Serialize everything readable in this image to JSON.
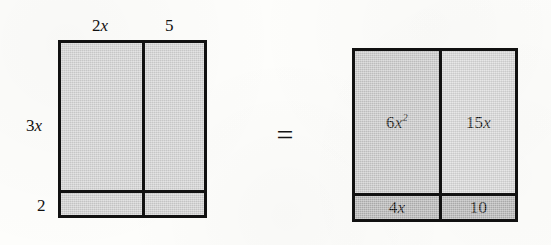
{
  "figure": {
    "kind": "algebra-tiles-area-model",
    "equals_symbol": "=",
    "colors": {
      "paper_background": "#fdfdfb",
      "border": "#111111",
      "shade_light": "#d2d2d2",
      "shade_medium": "#c8c8c8",
      "shade_dark": "#b4b4b4",
      "text": "#111111"
    }
  },
  "left_diagram": {
    "name": "factored-rectangle",
    "width_labels": {
      "first": {
        "coefficient": "2",
        "variable": "x"
      },
      "second": {
        "value": "5"
      }
    },
    "height_labels": {
      "first": {
        "coefficient": "3",
        "variable": "x"
      },
      "second": {
        "value": "2"
      }
    },
    "cells": [
      {
        "id": "top-left",
        "label": "",
        "shade": "light"
      },
      {
        "id": "top-right",
        "label": "",
        "shade": "light"
      },
      {
        "id": "bottom-left",
        "label": "",
        "shade": "light"
      },
      {
        "id": "bottom-right",
        "label": "",
        "shade": "light"
      }
    ]
  },
  "right_diagram": {
    "name": "expanded-rectangle",
    "cells": [
      {
        "id": "top-left",
        "coefficient": "6",
        "variable": "x",
        "exponent": "2",
        "shade": "medium"
      },
      {
        "id": "top-right",
        "coefficient": "15",
        "variable": "x",
        "exponent": "",
        "shade": "light"
      },
      {
        "id": "bottom-left",
        "coefficient": "4",
        "variable": "x",
        "exponent": "",
        "shade": "dark"
      },
      {
        "id": "bottom-right",
        "coefficient": "10",
        "variable": "",
        "exponent": "",
        "shade": "dark"
      }
    ]
  },
  "chart_data": {
    "type": "table",
    "title": "",
    "row_headers": [
      "3x",
      "2"
    ],
    "column_headers": [
      "2x",
      "5"
    ],
    "cells": [
      [
        "6x²",
        "15x"
      ],
      [
        "4x",
        "10"
      ]
    ],
    "relation": "="
  }
}
